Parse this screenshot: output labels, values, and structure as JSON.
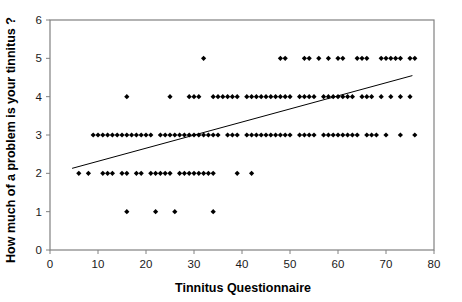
{
  "chart_data": {
    "type": "scatter",
    "title": "",
    "xlabel": "Tinnitus Questionnaire",
    "ylabel": "How much of a problem is your tinnitus ?",
    "xlim": [
      0,
      80
    ],
    "ylim": [
      0,
      6
    ],
    "xticks": [
      0,
      10,
      20,
      30,
      40,
      50,
      60,
      70,
      80
    ],
    "yticks": [
      0,
      1,
      2,
      3,
      4,
      5,
      6
    ],
    "grid": false,
    "legend": null,
    "marker": "diamond",
    "marker_color": "#000000",
    "plot_border_color": "#808080",
    "trendline": {
      "type": "linear-fit",
      "color": "#000000",
      "x_start": 4.6,
      "y_start": 2.13,
      "x_end": 75.5,
      "y_end": 4.55
    },
    "points": [
      {
        "x": 6,
        "y": 2
      },
      {
        "x": 8,
        "y": 2
      },
      {
        "x": 11,
        "y": 2
      },
      {
        "x": 12,
        "y": 2
      },
      {
        "x": 13,
        "y": 2
      },
      {
        "x": 15,
        "y": 2
      },
      {
        "x": 16,
        "y": 2
      },
      {
        "x": 18,
        "y": 2
      },
      {
        "x": 19,
        "y": 2
      },
      {
        "x": 21,
        "y": 2
      },
      {
        "x": 22,
        "y": 2
      },
      {
        "x": 23,
        "y": 2
      },
      {
        "x": 24,
        "y": 2
      },
      {
        "x": 25,
        "y": 2
      },
      {
        "x": 27,
        "y": 2
      },
      {
        "x": 28,
        "y": 2
      },
      {
        "x": 29,
        "y": 2
      },
      {
        "x": 30,
        "y": 2
      },
      {
        "x": 31,
        "y": 2
      },
      {
        "x": 32,
        "y": 2
      },
      {
        "x": 33,
        "y": 2
      },
      {
        "x": 34,
        "y": 2
      },
      {
        "x": 39,
        "y": 2
      },
      {
        "x": 42,
        "y": 2
      },
      {
        "x": 9,
        "y": 3
      },
      {
        "x": 10,
        "y": 3
      },
      {
        "x": 11,
        "y": 3
      },
      {
        "x": 12,
        "y": 3
      },
      {
        "x": 13,
        "y": 3
      },
      {
        "x": 14,
        "y": 3
      },
      {
        "x": 15,
        "y": 3
      },
      {
        "x": 16,
        "y": 3
      },
      {
        "x": 17,
        "y": 3
      },
      {
        "x": 18,
        "y": 3
      },
      {
        "x": 19,
        "y": 3
      },
      {
        "x": 20,
        "y": 3
      },
      {
        "x": 21,
        "y": 3
      },
      {
        "x": 23,
        "y": 3
      },
      {
        "x": 24,
        "y": 3
      },
      {
        "x": 25,
        "y": 3
      },
      {
        "x": 26,
        "y": 3
      },
      {
        "x": 27,
        "y": 3
      },
      {
        "x": 28,
        "y": 3
      },
      {
        "x": 29,
        "y": 3
      },
      {
        "x": 30,
        "y": 3
      },
      {
        "x": 31,
        "y": 3
      },
      {
        "x": 32,
        "y": 3
      },
      {
        "x": 33,
        "y": 3
      },
      {
        "x": 34,
        "y": 3
      },
      {
        "x": 35,
        "y": 3
      },
      {
        "x": 37,
        "y": 3
      },
      {
        "x": 38,
        "y": 3
      },
      {
        "x": 39,
        "y": 3
      },
      {
        "x": 41,
        "y": 3
      },
      {
        "x": 42,
        "y": 3
      },
      {
        "x": 43,
        "y": 3
      },
      {
        "x": 44,
        "y": 3
      },
      {
        "x": 45,
        "y": 3
      },
      {
        "x": 46,
        "y": 3
      },
      {
        "x": 47,
        "y": 3
      },
      {
        "x": 48,
        "y": 3
      },
      {
        "x": 49,
        "y": 3
      },
      {
        "x": 50,
        "y": 3
      },
      {
        "x": 52,
        "y": 3
      },
      {
        "x": 53,
        "y": 3
      },
      {
        "x": 54,
        "y": 3
      },
      {
        "x": 55,
        "y": 3
      },
      {
        "x": 57,
        "y": 3
      },
      {
        "x": 58,
        "y": 3
      },
      {
        "x": 59,
        "y": 3
      },
      {
        "x": 60,
        "y": 3
      },
      {
        "x": 61,
        "y": 3
      },
      {
        "x": 62,
        "y": 3
      },
      {
        "x": 63,
        "y": 3
      },
      {
        "x": 64,
        "y": 3
      },
      {
        "x": 66,
        "y": 3
      },
      {
        "x": 67,
        "y": 3
      },
      {
        "x": 68,
        "y": 3
      },
      {
        "x": 70,
        "y": 3
      },
      {
        "x": 73,
        "y": 3
      },
      {
        "x": 76,
        "y": 3
      },
      {
        "x": 16,
        "y": 4
      },
      {
        "x": 25,
        "y": 4
      },
      {
        "x": 29,
        "y": 4
      },
      {
        "x": 30,
        "y": 4
      },
      {
        "x": 31,
        "y": 4
      },
      {
        "x": 34,
        "y": 4
      },
      {
        "x": 35,
        "y": 4
      },
      {
        "x": 36,
        "y": 4
      },
      {
        "x": 37,
        "y": 4
      },
      {
        "x": 38,
        "y": 4
      },
      {
        "x": 39,
        "y": 4
      },
      {
        "x": 41,
        "y": 4
      },
      {
        "x": 42,
        "y": 4
      },
      {
        "x": 43,
        "y": 4
      },
      {
        "x": 44,
        "y": 4
      },
      {
        "x": 45,
        "y": 4
      },
      {
        "x": 46,
        "y": 4
      },
      {
        "x": 47,
        "y": 4
      },
      {
        "x": 48,
        "y": 4
      },
      {
        "x": 49,
        "y": 4
      },
      {
        "x": 50,
        "y": 4
      },
      {
        "x": 52,
        "y": 4
      },
      {
        "x": 53,
        "y": 4
      },
      {
        "x": 54,
        "y": 4
      },
      {
        "x": 55,
        "y": 4
      },
      {
        "x": 57,
        "y": 4
      },
      {
        "x": 58,
        "y": 4
      },
      {
        "x": 59,
        "y": 4
      },
      {
        "x": 60,
        "y": 4
      },
      {
        "x": 61,
        "y": 4
      },
      {
        "x": 62,
        "y": 4
      },
      {
        "x": 63,
        "y": 4
      },
      {
        "x": 65,
        "y": 4
      },
      {
        "x": 66,
        "y": 4
      },
      {
        "x": 67,
        "y": 4
      },
      {
        "x": 69,
        "y": 4
      },
      {
        "x": 71,
        "y": 4
      },
      {
        "x": 73,
        "y": 4
      },
      {
        "x": 75,
        "y": 4
      },
      {
        "x": 32,
        "y": 5
      },
      {
        "x": 48,
        "y": 5
      },
      {
        "x": 49,
        "y": 5
      },
      {
        "x": 53,
        "y": 5
      },
      {
        "x": 54,
        "y": 5
      },
      {
        "x": 56,
        "y": 5
      },
      {
        "x": 58,
        "y": 5
      },
      {
        "x": 60,
        "y": 5
      },
      {
        "x": 61,
        "y": 5
      },
      {
        "x": 64,
        "y": 5
      },
      {
        "x": 65,
        "y": 5
      },
      {
        "x": 66,
        "y": 5
      },
      {
        "x": 69,
        "y": 5
      },
      {
        "x": 70,
        "y": 5
      },
      {
        "x": 71,
        "y": 5
      },
      {
        "x": 72,
        "y": 5
      },
      {
        "x": 73,
        "y": 5
      },
      {
        "x": 75,
        "y": 5
      },
      {
        "x": 76,
        "y": 5
      },
      {
        "x": 16,
        "y": 1
      },
      {
        "x": 22,
        "y": 1
      },
      {
        "x": 26,
        "y": 1
      },
      {
        "x": 34,
        "y": 1
      }
    ]
  }
}
